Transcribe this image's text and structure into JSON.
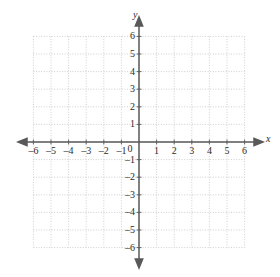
{
  "chart_data": {
    "type": "scatter",
    "title": "",
    "subtitle": "",
    "xlabel": "x",
    "ylabel": "y",
    "xlim": [
      -6,
      6
    ],
    "ylim": [
      -6,
      6
    ],
    "grid": true,
    "grid_style": "dotted",
    "grid_step": 1,
    "legend": null,
    "series": [],
    "values": [],
    "x": [],
    "annotations": [],
    "origin_label": "0",
    "x_tick_labels": [
      "–6",
      "–5",
      "–4",
      "–3",
      "–2",
      "–1",
      "1",
      "2",
      "3",
      "4",
      "5",
      "6"
    ],
    "x_tick_values": [
      -6,
      -5,
      -4,
      -3,
      -2,
      -1,
      1,
      2,
      3,
      4,
      5,
      6
    ],
    "y_tick_labels": [
      "6",
      "5",
      "4",
      "3",
      "2",
      "1",
      "–1",
      "–2",
      "–3",
      "–4",
      "–5",
      "–6"
    ],
    "y_tick_values": [
      6,
      5,
      4,
      3,
      2,
      1,
      -1,
      -2,
      -3,
      -4,
      -5,
      -6
    ],
    "axis_arrows": [
      "left",
      "right",
      "up",
      "down"
    ]
  },
  "colors": {
    "background": "#ffffff",
    "grid": "#c9c9c9",
    "axis": "#595959",
    "text": "#2b2b2b"
  },
  "geometry": {
    "origin_x": 139,
    "origin_y": 142,
    "unit_px": 17.6
  }
}
